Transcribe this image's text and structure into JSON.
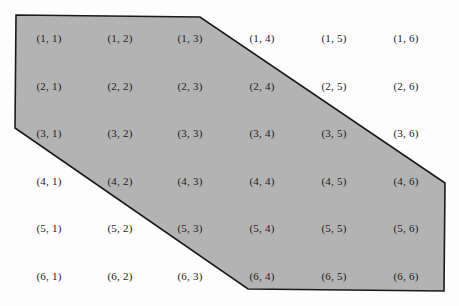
{
  "diagram": {
    "type": "sample-space-grid",
    "rows": 6,
    "cols": 6,
    "region_fill": "#b3b3b3",
    "region_stroke": "#1a1a1a",
    "region_polygon": [
      [
        16,
        15
      ],
      [
        200,
        17
      ],
      [
        445,
        183
      ],
      [
        444,
        291
      ],
      [
        248,
        289
      ],
      [
        15,
        128
      ]
    ],
    "col_x": [
      49,
      120,
      190,
      262,
      334,
      406
    ],
    "row_y": [
      38,
      86,
      133,
      181,
      228,
      276
    ],
    "cells": [
      [
        "(1, 1)",
        "(1, 2)",
        "(1, 3)",
        "(1, 4)",
        "(1, 5)",
        "(1, 6)"
      ],
      [
        "(2, 1)",
        "(2, 2)",
        "(2, 3)",
        "(2, 4)",
        "(2, 5)",
        "(2, 6)"
      ],
      [
        "(3, 1)",
        "(3, 2)",
        "(3, 3)",
        "(3, 4)",
        "(3, 5)",
        "(3, 6)"
      ],
      [
        "(4, 1)",
        "(4, 2)",
        "(4, 3)",
        "(4, 4)",
        "(4, 5)",
        "(4, 6)"
      ],
      [
        "(5, 1)",
        "(5, 2)",
        "(5, 3)",
        "(5, 4)",
        "(5, 5)",
        "(5, 6)"
      ],
      [
        "(6, 1)",
        "(6, 2)",
        "(6, 3)",
        "(6, 4)",
        "(6, 5)",
        "(6, 6)"
      ]
    ],
    "shaded_cells": [
      "(1, 1)",
      "(1, 2)",
      "(1, 3)",
      "(2, 1)",
      "(2, 2)",
      "(2, 3)",
      "(2, 4)",
      "(3, 1)",
      "(3, 2)",
      "(3, 3)",
      "(3, 4)",
      "(3, 5)",
      "(4, 2)",
      "(4, 3)",
      "(4, 4)",
      "(4, 5)",
      "(4, 6)",
      "(5, 3)",
      "(5, 4)",
      "(5, 5)",
      "(5, 6)",
      "(6, 4)",
      "(6, 5)",
      "(6, 6)"
    ]
  }
}
